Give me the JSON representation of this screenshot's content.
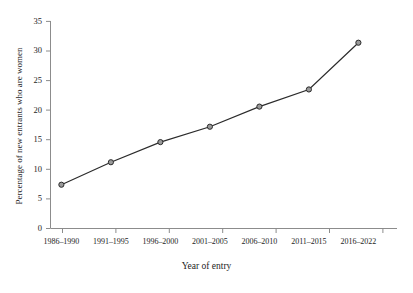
{
  "chart_data": {
    "type": "line",
    "title": "",
    "xlabel": "Year of entry",
    "ylabel": "Percentage of new entrants who are women",
    "categories": [
      "1986–1990",
      "1991–1995",
      "1996–2000",
      "2001–2005",
      "2006–2010",
      "2011–2015",
      "2016–2022"
    ],
    "values": [
      7.4,
      11.2,
      14.6,
      17.2,
      20.6,
      23.5,
      31.4
    ],
    "ylim": [
      0,
      35
    ],
    "yticks": [
      0,
      5,
      10,
      15,
      20,
      25,
      30,
      35
    ],
    "ytick_labels": [
      "0",
      "5",
      "10",
      "15",
      "20",
      "25",
      "30",
      "35"
    ],
    "grid": false,
    "legend": "none",
    "marker": "open-circle",
    "line_color": "#2b2b2b",
    "marker_fill": "#9a9a9a",
    "marker_edge": "#2b2b2b",
    "axis_color": "#8c8c8c"
  }
}
